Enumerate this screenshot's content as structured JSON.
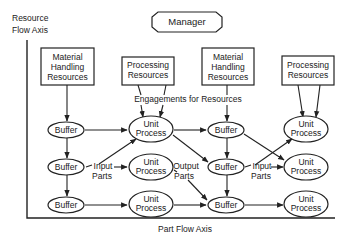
{
  "diagram": {
    "manager": {
      "label": "Manager"
    },
    "axes": {
      "resource_flow_line1": "Resource",
      "resource_flow_line2": "Flow Axis",
      "part_flow": "Part Flow Axis"
    },
    "resource_boxes": [
      {
        "id": "mh1",
        "lines": [
          "Material",
          "Handling",
          "Resources"
        ]
      },
      {
        "id": "pr1",
        "lines": [
          "Processing",
          "Resources"
        ]
      },
      {
        "id": "mh2",
        "lines": [
          "Material",
          "Handling",
          "Resources"
        ]
      },
      {
        "id": "pr2",
        "lines": [
          "Processing",
          "Resources"
        ]
      }
    ],
    "engagements_label": "Engagements for Resources",
    "buffers": [
      {
        "id": "b11",
        "label": "Buffer"
      },
      {
        "id": "b12",
        "label": "Buffer"
      },
      {
        "id": "b13",
        "label": "Buffer"
      },
      {
        "id": "b21",
        "label": "Buffer"
      },
      {
        "id": "b22",
        "label": "Buffer"
      },
      {
        "id": "b23",
        "label": "Buffer"
      }
    ],
    "unit_processes": [
      {
        "id": "u11",
        "lines": [
          "Unit",
          "Process"
        ]
      },
      {
        "id": "u12",
        "lines": [
          "Unit",
          "Process"
        ]
      },
      {
        "id": "u13",
        "lines": [
          "Unit",
          "Process"
        ]
      },
      {
        "id": "u21",
        "lines": [
          "Unit",
          "Process"
        ]
      },
      {
        "id": "u22",
        "lines": [
          "Unit",
          "Process"
        ]
      },
      {
        "id": "u23",
        "lines": [
          "Unit",
          "Process"
        ]
      }
    ],
    "annotations": {
      "input_parts_1": [
        "Input",
        "Parts"
      ],
      "output_parts": [
        "Output",
        "Parts"
      ],
      "input_parts_2": [
        "Input",
        "Parts"
      ]
    },
    "colors": {
      "stroke": "#222222",
      "fill": "#ffffff",
      "text": "#222222"
    }
  }
}
